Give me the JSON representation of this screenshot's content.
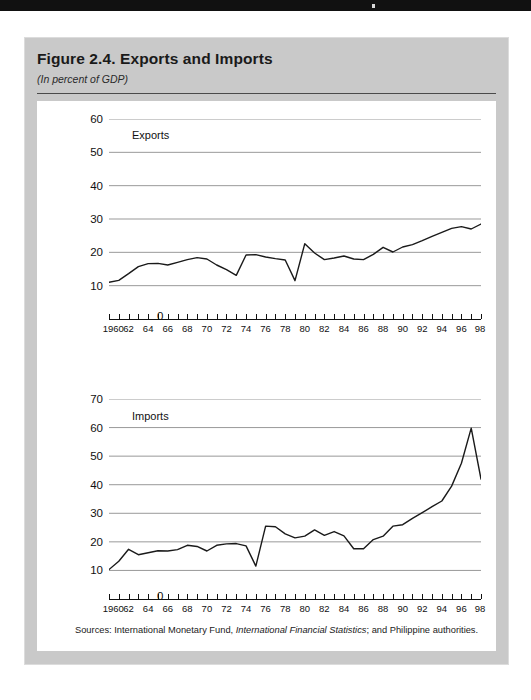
{
  "figure": {
    "title": "Figure 2.4.  Exports and Imports",
    "subtitle": "(In percent of GDP)",
    "source_prefix": "Sources:  International Monetary Fund, ",
    "source_italic": "International Financial Statistics",
    "source_suffix": "; and Philippine authorities."
  },
  "chart_data": [
    {
      "type": "line",
      "title": "Exports",
      "xlabel": "",
      "ylabel": "",
      "xlim": [
        1960,
        1998
      ],
      "ylim": [
        0,
        60
      ],
      "yticks": [
        0,
        10,
        20,
        30,
        40,
        50,
        60
      ],
      "ytick_labels": [
        "0",
        "10",
        "20",
        "30",
        "40",
        "50",
        "60"
      ],
      "grid": true,
      "legend": "none",
      "xticks": [
        1960,
        1962,
        1964,
        1966,
        1968,
        1970,
        1972,
        1974,
        1976,
        1978,
        1980,
        1982,
        1984,
        1986,
        1988,
        1990,
        1992,
        1994,
        1996,
        1998
      ],
      "xtick_labels": [
        "1960",
        "62",
        "64",
        "66",
        "68",
        "70",
        "72",
        "74",
        "76",
        "78",
        "80",
        "82",
        "84",
        "86",
        "88",
        "90",
        "92",
        "94",
        "96",
        "98"
      ],
      "x": [
        1960,
        1961,
        1962,
        1963,
        1964,
        1965,
        1966,
        1967,
        1968,
        1969,
        1970,
        1971,
        1972,
        1973,
        1974,
        1975,
        1976,
        1977,
        1978,
        1979,
        1980,
        1981,
        1982,
        1983,
        1984,
        1985,
        1986,
        1987,
        1988,
        1989,
        1990,
        1991,
        1992,
        1993,
        1994,
        1995,
        1996,
        1997,
        1998
      ],
      "values": [
        11.0,
        11.6,
        13.6,
        15.7,
        16.6,
        16.7,
        16.2,
        17.0,
        17.8,
        18.4,
        18.0,
        16.2,
        14.8,
        13.1,
        19.2,
        19.3,
        18.6,
        18.1,
        17.7,
        11.5,
        22.6,
        19.8,
        17.8,
        18.3,
        18.9,
        18.0,
        17.8,
        19.4,
        21.5,
        20.1,
        21.6,
        22.3,
        23.5,
        24.8,
        26.0,
        27.2,
        27.7,
        27.0,
        28.5
      ],
      "axis_color": "#111111",
      "grid_color": "#999999",
      "line_color": "#1a1a1a"
    },
    {
      "type": "line",
      "title": "Imports",
      "xlabel": "",
      "ylabel": "",
      "xlim": [
        1960,
        1998
      ],
      "ylim": [
        0,
        70
      ],
      "yticks": [
        0,
        10,
        20,
        30,
        40,
        50,
        60,
        70
      ],
      "ytick_labels": [
        "0",
        "10",
        "20",
        "30",
        "40",
        "50",
        "60",
        "70"
      ],
      "grid": true,
      "legend": "none",
      "xticks": [
        1960,
        1962,
        1964,
        1966,
        1968,
        1970,
        1972,
        1974,
        1976,
        1978,
        1980,
        1982,
        1984,
        1986,
        1988,
        1990,
        1992,
        1994,
        1996,
        1998
      ],
      "xtick_labels": [
        "1960",
        "62",
        "64",
        "66",
        "68",
        "70",
        "72",
        "74",
        "76",
        "78",
        "80",
        "82",
        "84",
        "86",
        "88",
        "90",
        "92",
        "94",
        "96",
        "98"
      ],
      "x": [
        1960,
        1961,
        1962,
        1963,
        1964,
        1965,
        1966,
        1967,
        1968,
        1969,
        1970,
        1971,
        1972,
        1973,
        1974,
        1975,
        1976,
        1977,
        1978,
        1979,
        1980,
        1981,
        1982,
        1983,
        1984,
        1985,
        1986,
        1987,
        1988,
        1989,
        1990,
        1991,
        1992,
        1993,
        1994,
        1995,
        1996,
        1997,
        1998
      ],
      "values": [
        10.3,
        13.2,
        17.4,
        15.5,
        16.2,
        16.9,
        16.8,
        17.3,
        18.8,
        18.4,
        16.8,
        18.8,
        19.3,
        19.4,
        18.6,
        11.5,
        25.5,
        25.3,
        22.8,
        21.4,
        22.0,
        24.2,
        22.3,
        23.6,
        22.1,
        17.6,
        17.6,
        20.8,
        22.0,
        25.5,
        26.0,
        28.2,
        30.2,
        32.3,
        34.3,
        39.5,
        47.5,
        59.8,
        42.0
      ],
      "axis_color": "#111111",
      "grid_color": "#999999",
      "line_color": "#1a1a1a"
    }
  ]
}
